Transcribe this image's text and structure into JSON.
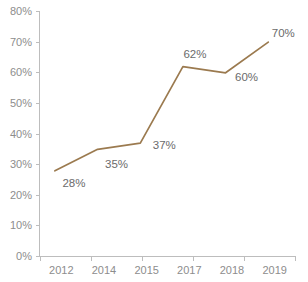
{
  "chart_data": {
    "type": "line",
    "title": "",
    "subtitle": "",
    "xlabel": "",
    "ylabel": "",
    "categories": [
      "2012",
      "2014",
      "2015",
      "2017",
      "2018",
      "2019"
    ],
    "values": [
      28,
      35,
      37,
      62,
      60,
      70
    ],
    "data_labels": [
      "28%",
      "35%",
      "37%",
      "62%",
      "60%",
      "70%"
    ],
    "ylim": [
      0,
      80
    ],
    "ytick_values": [
      0,
      10,
      20,
      30,
      40,
      50,
      60,
      70,
      80
    ],
    "ytick_labels": [
      "0%",
      "10%",
      "20%",
      "30%",
      "40%",
      "50%",
      "60%",
      "70%",
      "80%"
    ],
    "grid": false,
    "legend": false,
    "legend_position": "none",
    "series": [
      {
        "name": "",
        "values": [
          28,
          35,
          37,
          62,
          60,
          70
        ]
      }
    ],
    "colors": {
      "line": "#9b7a4f",
      "axis": "#bdbdbd",
      "tick_text": "#8d8d8d",
      "data_label_text": "#6b6b6b",
      "background": "#ffffff"
    }
  },
  "axes": {
    "y": {
      "ticks": [
        {
          "label": "80%",
          "value": 80
        },
        {
          "label": "70%",
          "value": 70
        },
        {
          "label": "60%",
          "value": 60
        },
        {
          "label": "50%",
          "value": 50
        },
        {
          "label": "40%",
          "value": 40
        },
        {
          "label": "30%",
          "value": 30
        },
        {
          "label": "20%",
          "value": 20
        },
        {
          "label": "10%",
          "value": 10
        },
        {
          "label": "0%",
          "value": 0
        }
      ]
    },
    "x": {
      "ticks": [
        {
          "label": "2012"
        },
        {
          "label": "2014"
        },
        {
          "label": "2015"
        },
        {
          "label": "2017"
        },
        {
          "label": "2018"
        },
        {
          "label": "2019"
        }
      ]
    }
  },
  "points": [
    {
      "category": "2012",
      "label": "28%",
      "value": 28
    },
    {
      "category": "2014",
      "label": "35%",
      "value": 35
    },
    {
      "category": "2015",
      "label": "37%",
      "value": 37
    },
    {
      "category": "2017",
      "label": "62%",
      "value": 62
    },
    {
      "category": "2018",
      "label": "60%",
      "value": 60
    },
    {
      "category": "2019",
      "label": "70%",
      "value": 70
    }
  ]
}
